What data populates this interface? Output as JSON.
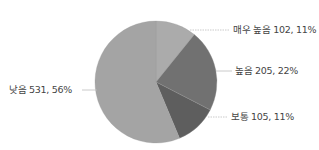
{
  "chart_data": {
    "type": "pie",
    "title": "",
    "categories": [
      "매우 높음",
      "높음",
      "보통",
      "낮음"
    ],
    "values": [
      102,
      205,
      105,
      531
    ],
    "percentages": [
      11,
      22,
      11,
      56
    ],
    "colors": [
      "#ababab",
      "#717171",
      "#5e5e5e",
      "#a4a4a4"
    ],
    "start_angle_deg": 0,
    "direction": "clockwise",
    "legend": "none",
    "data_labels": [
      "매우 높음 102, 11%",
      "높음 205, 22%",
      "보통 105, 11%",
      "낮음 531, 56%"
    ]
  },
  "labels": {
    "very_high": "매우 높음 102, 11%",
    "high": "높음 205, 22%",
    "medium": "보통 105, 11%",
    "low": "낮음 531, 56%"
  }
}
